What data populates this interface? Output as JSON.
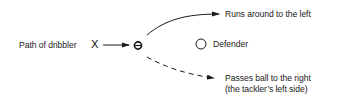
{
  "diagram": {
    "dribbler_label": "Path of dribbler",
    "dribbler_marker": "X",
    "defender_label": "Defender",
    "option_run": {
      "label": "Runs around to the left",
      "line_style": "solid"
    },
    "option_pass": {
      "label_line1": "Passes ball to the right",
      "label_line2": "(the tackler’s left side)",
      "line_style": "dashed"
    },
    "icons": {
      "dribbler": "x-marker",
      "ball": "ball-icon",
      "defender": "open-circle"
    },
    "colors": {
      "ink": "#1a1a1a",
      "background": "#ffffff"
    }
  }
}
